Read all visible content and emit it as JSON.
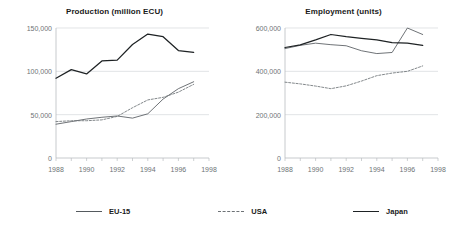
{
  "figure": {
    "background": "#ffffff",
    "series_colors": {
      "EU-15": "#555a5e",
      "USA": "#6d7276",
      "Japan": "#1e2224"
    }
  },
  "legend": {
    "position": "bottom",
    "items": [
      {
        "label": "EU-15",
        "style": "solid",
        "key_name": "legend-key-eu15"
      },
      {
        "label": "USA",
        "style": "dashed",
        "key_name": "legend-key-usa"
      },
      {
        "label": "Japan",
        "style": "solid-bold",
        "key_name": "legend-key-japan"
      }
    ]
  },
  "chart_data": [
    {
      "type": "line",
      "title": "Production (million ECU)",
      "xlabel": "",
      "ylabel": "",
      "xlim": [
        1988,
        1998
      ],
      "ylim": [
        0,
        150000
      ],
      "yticks": [
        0,
        50000,
        100000,
        150000
      ],
      "ytick_labels": [
        "0",
        "50,000",
        "100,000",
        "150,000"
      ],
      "xticks": [
        1988,
        1989,
        1990,
        1991,
        1992,
        1993,
        1994,
        1995,
        1996,
        1997,
        1998
      ],
      "xtick_labels": [
        "1988",
        "",
        "1990",
        "",
        "1992",
        "",
        "1994",
        "",
        "1996",
        "",
        "1998"
      ],
      "grid": "horizontal",
      "x": [
        1988,
        1989,
        1990,
        1991,
        1992,
        1993,
        1994,
        1995,
        1996,
        1997
      ],
      "series": [
        {
          "name": "EU-15",
          "style": "solid",
          "values": [
            39000,
            42000,
            45000,
            47000,
            48500,
            46000,
            51000,
            68000,
            80000,
            88000
          ]
        },
        {
          "name": "USA",
          "style": "dashed",
          "values": [
            42000,
            43000,
            43000,
            44000,
            48000,
            58000,
            67000,
            70000,
            76000,
            85000
          ]
        },
        {
          "name": "Japan",
          "style": "solid-bold",
          "values": [
            92000,
            102000,
            97000,
            112000,
            113000,
            131000,
            143000,
            140000,
            124000,
            122000
          ]
        }
      ]
    },
    {
      "type": "line",
      "title": "Employment (units)",
      "xlabel": "",
      "ylabel": "",
      "xlim": [
        1988,
        1998
      ],
      "ylim": [
        0,
        600000
      ],
      "yticks": [
        0,
        200000,
        400000,
        600000
      ],
      "ytick_labels": [
        "0",
        "200,000",
        "400,000",
        "600,000"
      ],
      "xticks": [
        1988,
        1989,
        1990,
        1991,
        1992,
        1993,
        1994,
        1995,
        1996,
        1997,
        1998
      ],
      "xtick_labels": [
        "1988",
        "",
        "1990",
        "",
        "1992",
        "",
        "1994",
        "",
        "1996",
        "",
        "1998"
      ],
      "grid": "horizontal",
      "x": [
        1988,
        1989,
        1990,
        1991,
        1992,
        1993,
        1994,
        1995,
        1996,
        1997
      ],
      "series": [
        {
          "name": "EU-15",
          "style": "solid",
          "values": [
            505000,
            520000,
            530000,
            523000,
            518000,
            495000,
            482000,
            487000,
            600000,
            570000
          ]
        },
        {
          "name": "USA",
          "style": "dashed",
          "values": [
            350000,
            342000,
            332000,
            320000,
            333000,
            355000,
            380000,
            392000,
            400000,
            425000
          ]
        },
        {
          "name": "Japan",
          "style": "solid-bold",
          "values": [
            510000,
            522000,
            545000,
            570000,
            560000,
            552000,
            545000,
            533000,
            530000,
            520000
          ]
        }
      ]
    }
  ]
}
